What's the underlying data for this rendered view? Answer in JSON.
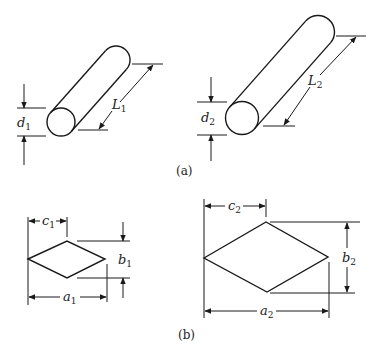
{
  "figure": {
    "panel_a": {
      "caption": "(a)",
      "cylinder_1": {
        "diameter_label": "d",
        "diameter_sub": "1",
        "length_label": "L",
        "length_sub": "1"
      },
      "cylinder_2": {
        "diameter_label": "d",
        "diameter_sub": "2",
        "length_label": "L",
        "length_sub": "2"
      }
    },
    "panel_b": {
      "caption": "(b)",
      "rhombus_1": {
        "width_label": "a",
        "width_sub": "1",
        "height_label": "b",
        "height_sub": "1",
        "offset_label": "c",
        "offset_sub": "1"
      },
      "rhombus_2": {
        "width_label": "a",
        "width_sub": "2",
        "height_label": "b",
        "height_sub": "2",
        "offset_label": "c",
        "offset_sub": "2"
      }
    }
  },
  "colors": {
    "line": "#1a1a1a",
    "background": "#ffffff"
  }
}
